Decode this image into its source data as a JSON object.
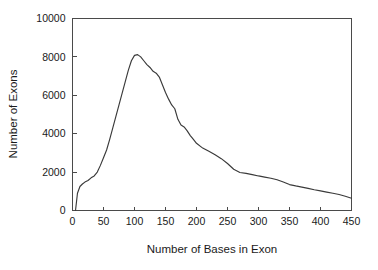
{
  "chart_data": {
    "type": "line",
    "title": "",
    "xlabel": "Number of Bases in Exon",
    "ylabel": "Number of Exons",
    "xlim": [
      0,
      450
    ],
    "ylim": [
      0,
      10000
    ],
    "xticks": [
      0,
      50,
      100,
      150,
      200,
      250,
      300,
      350,
      400,
      450
    ],
    "yticks": [
      0,
      2000,
      4000,
      6000,
      8000,
      10000
    ],
    "xtick_labels": [
      "0",
      "50",
      "100",
      "150",
      "200",
      "250",
      "300",
      "350",
      "400",
      "450"
    ],
    "ytick_labels": [
      "0",
      "2000",
      "4000",
      "6000",
      "8000",
      "10000"
    ],
    "grid": false,
    "legend": null,
    "series": [
      {
        "name": "Exon length distribution",
        "color": "#3a3a3a",
        "x": [
          5,
          8,
          12,
          16,
          20,
          25,
          30,
          35,
          40,
          45,
          50,
          55,
          60,
          65,
          70,
          75,
          80,
          85,
          90,
          95,
          100,
          105,
          110,
          115,
          120,
          125,
          130,
          135,
          140,
          145,
          150,
          155,
          160,
          165,
          170,
          175,
          180,
          185,
          190,
          195,
          200,
          210,
          220,
          230,
          240,
          250,
          260,
          270,
          280,
          290,
          300,
          310,
          320,
          330,
          340,
          350,
          360,
          370,
          380,
          390,
          400,
          410,
          420,
          430,
          440,
          450
        ],
        "y": [
          40,
          900,
          1250,
          1380,
          1480,
          1560,
          1700,
          1800,
          2000,
          2350,
          2750,
          3150,
          3700,
          4300,
          4900,
          5500,
          6100,
          6700,
          7300,
          7800,
          8080,
          8120,
          8000,
          7800,
          7600,
          7450,
          7250,
          7150,
          6950,
          6550,
          6150,
          5800,
          5500,
          5300,
          4750,
          4450,
          4350,
          4150,
          3900,
          3700,
          3500,
          3250,
          3080,
          2900,
          2700,
          2450,
          2150,
          1980,
          1930,
          1870,
          1800,
          1740,
          1680,
          1600,
          1480,
          1350,
          1280,
          1220,
          1150,
          1080,
          1020,
          960,
          900,
          830,
          740,
          640
        ]
      }
    ]
  },
  "axes": {
    "y_title": "Number of Exons",
    "x_title": "Number of Bases in Exon"
  }
}
